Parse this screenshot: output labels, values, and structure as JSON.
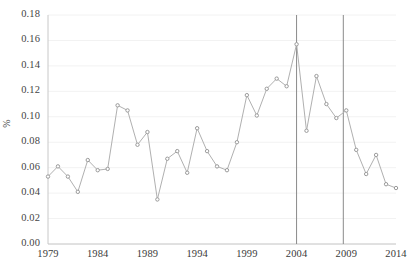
{
  "chart_data": {
    "type": "line",
    "title": "",
    "subtitle": "",
    "xlabel": "",
    "ylabel": "%",
    "xlim": [
      1979,
      2014
    ],
    "ylim": [
      0.0,
      0.18
    ],
    "grid": true,
    "legend": null,
    "marker": "circle",
    "line_color": "#b0b0b0",
    "marker_color": "#9a9a9a",
    "x": [
      1979,
      1980,
      1981,
      1982,
      1983,
      1984,
      1985,
      1986,
      1987,
      1988,
      1989,
      1990,
      1991,
      1992,
      1993,
      1994,
      1995,
      1996,
      1997,
      1998,
      1999,
      2000,
      2001,
      2002,
      2003,
      2004,
      2005,
      2006,
      2007,
      2008,
      2009,
      2010,
      2011,
      2012,
      2013,
      2014
    ],
    "values": [
      0.053,
      0.061,
      0.053,
      0.041,
      0.066,
      0.058,
      0.059,
      0.109,
      0.105,
      0.078,
      0.088,
      0.035,
      0.067,
      0.073,
      0.056,
      0.091,
      0.073,
      0.061,
      0.058,
      0.08,
      0.117,
      0.101,
      0.122,
      0.13,
      0.124,
      0.157,
      0.089,
      0.132,
      0.11,
      0.099,
      0.105,
      0.074,
      0.055,
      0.07,
      0.047,
      0.044
    ],
    "yticks": [
      {
        "value": 0.0,
        "label": "0.00"
      },
      {
        "value": 0.02,
        "label": "0.02"
      },
      {
        "value": 0.04,
        "label": "0.04"
      },
      {
        "value": 0.06,
        "label": "0.06"
      },
      {
        "value": 0.08,
        "label": "0.08"
      },
      {
        "value": 0.1,
        "label": "0.10"
      },
      {
        "value": 0.12,
        "label": "0.12"
      },
      {
        "value": 0.14,
        "label": "0.14"
      },
      {
        "value": 0.16,
        "label": "0.16"
      },
      {
        "value": 0.18,
        "label": "0.18"
      }
    ],
    "xticks": [
      {
        "value": 1979,
        "label": "1979"
      },
      {
        "value": 1984,
        "label": "1984"
      },
      {
        "value": 1989,
        "label": "1989"
      },
      {
        "value": 1994,
        "label": "1994"
      },
      {
        "value": 1999,
        "label": "1999"
      },
      {
        "value": 2004,
        "label": "2004"
      },
      {
        "value": 2009,
        "label": "2009"
      },
      {
        "value": 2014,
        "label": "2014"
      }
    ],
    "vertical_reference_lines": [
      {
        "value": 2004,
        "color": "#8a8a8a"
      },
      {
        "value": 2008.7,
        "color": "#8a8a8a"
      }
    ],
    "colors": {
      "line": "#b0b0b0",
      "marker": "#9a9a9a",
      "grid": "#f2f2f2",
      "axis": "#c8c8c8",
      "text": "#3a3a3a",
      "vline": "#8a8a8a",
      "background": "#ffffff"
    }
  }
}
